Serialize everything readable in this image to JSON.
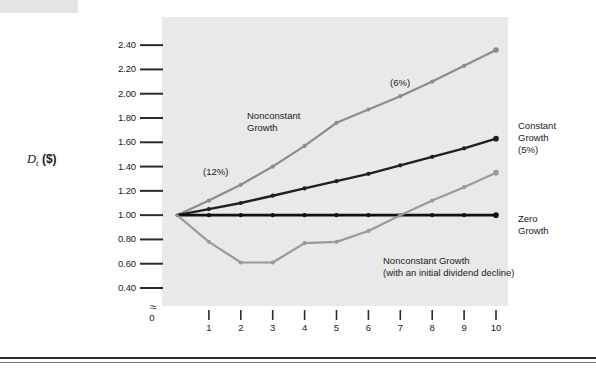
{
  "figure": {
    "y_axis_title_main": "D",
    "y_axis_title_sub": "t",
    "y_axis_title_unit": " ($)",
    "x_axis_title": "Year",
    "axis_break_symbol": "≈",
    "origin_label": "0"
  },
  "annotations": {
    "nonconstant_growth": "Nonconstant\nGrowth",
    "rate_6": "(6%)",
    "rate_12": "(12%)",
    "constant_growth": "Constant\nGrowth\n(5%)",
    "zero_growth": "Zero\nGrowth",
    "decline": "Nonconstant Growth\n(with an initial dividend decline)"
  },
  "colors": {
    "panel": "#e9e9e9",
    "zero_growth": "#111111",
    "constant_growth": "#1f1f1f",
    "nonconstant_growth": "#8c8c8c",
    "decline": "#9a9a9a",
    "axis": "#2b2b2b",
    "rule": "#2b2b2b"
  },
  "chart_data": {
    "type": "line",
    "title": "",
    "xlabel": "Year",
    "ylabel": "D_t ($)",
    "xlim": [
      0,
      10
    ],
    "ylim": [
      0.4,
      2.5
    ],
    "grid": false,
    "legend_position": "inline-annotations",
    "x": [
      0,
      1,
      2,
      3,
      4,
      5,
      6,
      7,
      8,
      9,
      10
    ],
    "ytick_labels": [
      "0.40",
      "0.60",
      "0.80",
      "1.00",
      "1.20",
      "1.40",
      "1.60",
      "1.80",
      "2.00",
      "2.20",
      "2.40"
    ],
    "ytick_values": [
      0.4,
      0.6,
      0.8,
      1.0,
      1.2,
      1.4,
      1.6,
      1.8,
      2.0,
      2.2,
      2.4
    ],
    "xtick_labels": [
      "1",
      "2",
      "3",
      "4",
      "5",
      "6",
      "7",
      "8",
      "9",
      "10"
    ],
    "xtick_values": [
      1,
      2,
      3,
      4,
      5,
      6,
      7,
      8,
      9,
      10
    ],
    "axis_break_below": 0.4,
    "series": [
      {
        "name": "Nonconstant Growth",
        "annotation_rates": [
          "(12%)",
          "(6%)"
        ],
        "color": "#8c8c8c",
        "values": [
          1.0,
          1.12,
          1.25,
          1.4,
          1.57,
          1.76,
          1.87,
          1.98,
          2.1,
          2.23,
          2.36
        ]
      },
      {
        "name": "Constant Growth (5%)",
        "color": "#1f1f1f",
        "values": [
          1.0,
          1.05,
          1.1,
          1.16,
          1.22,
          1.28,
          1.34,
          1.41,
          1.48,
          1.55,
          1.63
        ]
      },
      {
        "name": "Zero Growth",
        "color": "#111111",
        "values": [
          1.0,
          1.0,
          1.0,
          1.0,
          1.0,
          1.0,
          1.0,
          1.0,
          1.0,
          1.0,
          1.0
        ]
      },
      {
        "name": "Nonconstant Growth (with an initial dividend decline)",
        "color": "#9a9a9a",
        "values": [
          1.0,
          0.78,
          0.61,
          0.61,
          0.77,
          0.78,
          0.87,
          1.0,
          1.12,
          1.23,
          1.35
        ]
      }
    ]
  }
}
